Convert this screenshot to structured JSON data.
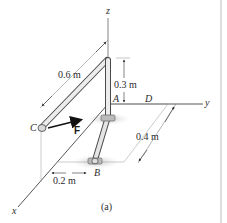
{
  "figure": {
    "caption": "(a)",
    "axes": {
      "x": "x",
      "y": "y",
      "z": "z"
    },
    "points": {
      "A": "A",
      "B": "B",
      "C": "C",
      "D": "D"
    },
    "force": {
      "label": "F"
    },
    "dimensions": {
      "top_pipe": "0.6 m",
      "vertical": "0.3 m",
      "depth": "0.4 m",
      "offset": "0.2 m"
    }
  },
  "colors": {
    "pipe_fill": "#e6e6e6",
    "pipe_stroke": "#4a4a4a",
    "axis": "#555555",
    "shadow": "#cfcfcf",
    "force": "#111111",
    "border": "#bdbdbd"
  }
}
